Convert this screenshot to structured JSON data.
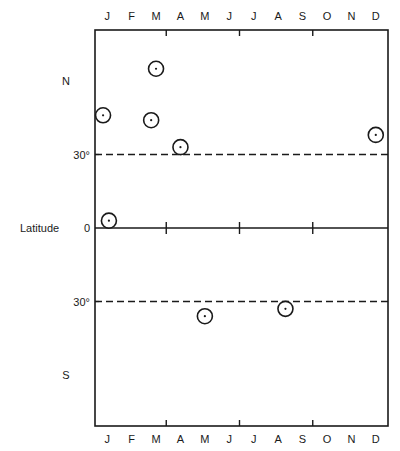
{
  "chart_data": {
    "type": "scatter",
    "title": "",
    "xlabel": "",
    "ylabel": "Latitude",
    "x_ticks_top": [
      "J",
      "F",
      "M",
      "A",
      "M",
      "J",
      "J",
      "A",
      "S",
      "O",
      "N",
      "D"
    ],
    "x_ticks_bottom": [
      "J",
      "F",
      "M",
      "A",
      "M",
      "J",
      "J",
      "A",
      "S",
      "O",
      "N",
      "D"
    ],
    "y_labels": [
      {
        "text": "N",
        "value": 60
      },
      {
        "text": "30°",
        "value": 30
      },
      {
        "text": "0",
        "value": 0
      },
      {
        "text": "30°",
        "value": -30
      },
      {
        "text": "S",
        "value": -60
      }
    ],
    "xlim": [
      0,
      12
    ],
    "ylim": [
      -81,
      81
    ],
    "reference_lines": [
      {
        "value": 30,
        "style": "dashed"
      },
      {
        "value": 0,
        "style": "solid"
      },
      {
        "value": -30,
        "style": "dashed"
      }
    ],
    "quarter_ticks_x": [
      3,
      6,
      9
    ],
    "marker": "circle-with-dot",
    "points": [
      {
        "month": 0.33,
        "label": "Jan",
        "latitude": 46
      },
      {
        "month": 0.57,
        "label": "Jan",
        "latitude": 3
      },
      {
        "month": 2.3,
        "label": "Mar",
        "latitude": 44
      },
      {
        "month": 2.5,
        "label": "Mar",
        "latitude": 65
      },
      {
        "month": 3.5,
        "label": "Apr",
        "latitude": 33
      },
      {
        "month": 4.5,
        "label": "May",
        "latitude": -36
      },
      {
        "month": 7.8,
        "label": "Aug",
        "latitude": -33
      },
      {
        "month": 11.5,
        "label": "Dec",
        "latitude": 38
      }
    ],
    "grid": false,
    "legend": null
  },
  "axis": {
    "ylabel": "Latitude",
    "north": "N",
    "south": "S",
    "deg30": "30°",
    "zero": "0"
  }
}
